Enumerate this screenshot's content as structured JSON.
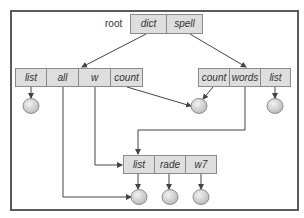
{
  "diagram": {
    "title": "",
    "root_label": "root",
    "colors": {
      "frame": "#5a5a5a",
      "cell_fill": "#dedede",
      "cell_border": "#8a8a8a",
      "arrow": "#444444",
      "leaf_fill": "#d4d4d4"
    },
    "root_node": {
      "cells": [
        {
          "label": "dict"
        },
        {
          "label": "spell"
        }
      ]
    },
    "dict_node": {
      "cells": [
        {
          "label": "list"
        },
        {
          "label": "all"
        },
        {
          "label": "w"
        },
        {
          "label": "count"
        }
      ]
    },
    "spell_node": {
      "cells": [
        {
          "label": "count"
        },
        {
          "label": "words"
        },
        {
          "label": "list"
        }
      ]
    },
    "shared_node": {
      "cells": [
        {
          "label": "list"
        },
        {
          "label": "rade"
        },
        {
          "label": "w7"
        }
      ]
    },
    "edges": [
      {
        "from": "root.dict",
        "to": "dict_node"
      },
      {
        "from": "root.spell",
        "to": "spell_node"
      },
      {
        "from": "dict.list",
        "to": "leaf-1"
      },
      {
        "from": "dict.all",
        "to": "leaf-shared-list"
      },
      {
        "from": "dict.w",
        "to": "shared_node"
      },
      {
        "from": "dict.count",
        "to": "leaf-2"
      },
      {
        "from": "spell.count",
        "to": "leaf-2"
      },
      {
        "from": "spell.words",
        "to": "shared_node"
      },
      {
        "from": "spell.list",
        "to": "leaf-3"
      },
      {
        "from": "shared.list",
        "to": "leaf-shared-list"
      },
      {
        "from": "shared.rade",
        "to": "leaf-rade"
      },
      {
        "from": "shared.w7",
        "to": "leaf-w7"
      }
    ]
  }
}
